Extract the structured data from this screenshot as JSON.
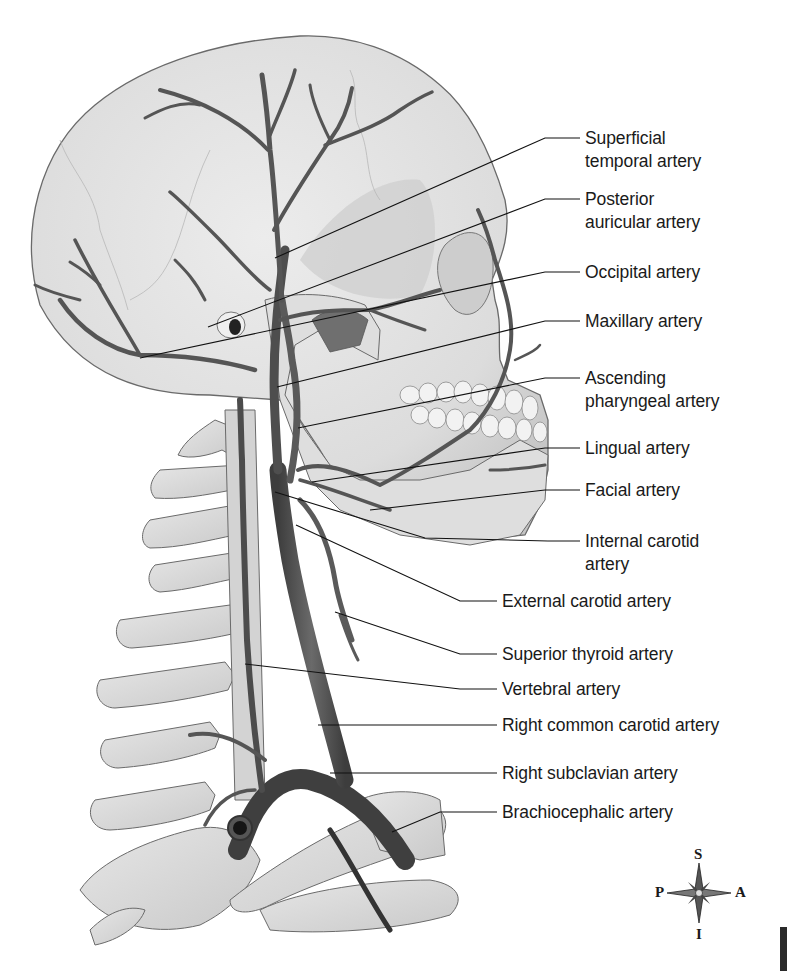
{
  "figure": {
    "colors": {
      "bone_fill": "#e2e2e2",
      "bone_shadow": "#bdbdbd",
      "bone_outline": "#6a6a6a",
      "artery": "#555555",
      "artery_dark": "#3a3a3a",
      "leader_line": "#111111",
      "text": "#1a1a1a"
    }
  },
  "labels": [
    {
      "id": "superficial-temporal",
      "lines": [
        "Superficial",
        "temporal artery"
      ],
      "text": "Superficial\ntemporal artery",
      "x": 585,
      "y": 127
    },
    {
      "id": "posterior-auricular",
      "lines": [
        "Posterior",
        "auricular artery"
      ],
      "text": "Posterior\nauricular artery",
      "x": 585,
      "y": 188
    },
    {
      "id": "occipital",
      "text": "Occipital artery",
      "x": 585,
      "y": 261
    },
    {
      "id": "maxillary",
      "text": "Maxillary artery",
      "x": 585,
      "y": 310
    },
    {
      "id": "ascending-pharyngeal",
      "text": "Ascending\npharyngeal artery",
      "x": 585,
      "y": 367
    },
    {
      "id": "lingual",
      "text": "Lingual artery",
      "x": 585,
      "y": 437
    },
    {
      "id": "facial",
      "text": "Facial artery",
      "x": 585,
      "y": 479
    },
    {
      "id": "internal-carotid",
      "text": "Internal carotid\nartery",
      "x": 585,
      "y": 530
    },
    {
      "id": "external-carotid",
      "text": "External carotid artery",
      "x": 502,
      "y": 590
    },
    {
      "id": "superior-thyroid",
      "text": "Superior thyroid artery",
      "x": 502,
      "y": 643
    },
    {
      "id": "vertebral",
      "text": "Vertebral artery",
      "x": 502,
      "y": 678
    },
    {
      "id": "right-common-carotid",
      "text": "Right common carotid artery",
      "x": 502,
      "y": 714
    },
    {
      "id": "right-subclavian",
      "text": "Right subclavian artery",
      "x": 502,
      "y": 762
    },
    {
      "id": "brachiocephalic",
      "text": "Brachiocephalic artery",
      "x": 502,
      "y": 801
    }
  ],
  "leaders": [
    {
      "label": "superficial-temporal",
      "points": "580,138 545,138 275,258"
    },
    {
      "label": "posterior-auricular",
      "points": "580,199 545,199 208,327"
    },
    {
      "label": "occipital",
      "points": "580,272 545,272 140,358"
    },
    {
      "label": "maxillary",
      "points": "580,321 545,321 277,387"
    },
    {
      "label": "ascending-pharyngeal",
      "points": "580,378 545,378 298,428"
    },
    {
      "label": "lingual",
      "points": "580,448 545,448 312,482"
    },
    {
      "label": "facial",
      "points": "580,490 545,490 370,510"
    },
    {
      "label": "internal-carotid",
      "points": "580,541 548,541 425,538 275,492"
    },
    {
      "label": "external-carotid",
      "points": "497,601 460,601 296,525"
    },
    {
      "label": "superior-thyroid",
      "points": "497,654 460,654 335,612"
    },
    {
      "label": "vertebral",
      "points": "497,689 460,689 245,664"
    },
    {
      "label": "right-common-carotid",
      "points": "497,725 462,725 318,725"
    },
    {
      "label": "right-subclavian",
      "points": "497,773 462,773 330,773"
    },
    {
      "label": "brachiocephalic",
      "points": "497,812 440,812 392,832"
    }
  ],
  "compass": {
    "superior": "S",
    "inferior": "I",
    "posterior": "P",
    "anterior": "A"
  }
}
